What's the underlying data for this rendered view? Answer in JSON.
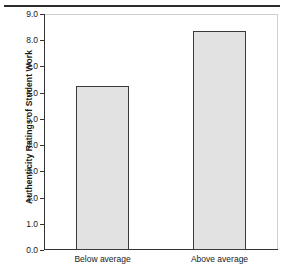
{
  "figure": {
    "background": "#ffffff",
    "caption_rule": "horizontal-rule",
    "caption_ghost": ""
  },
  "chart_data": {
    "type": "bar",
    "title": "",
    "subtitle": "",
    "xlabel": "",
    "ylabel": "Authenticity Ratings of Student Work",
    "categories": [
      "Below average",
      "Above average"
    ],
    "values": [
      6.25,
      8.35
    ],
    "ylim": [
      0.0,
      9.0
    ],
    "ytick_labels": [
      "0.0",
      "1.0",
      "2.0",
      "3.0",
      "4.0",
      "5.0",
      "6.0",
      "7.0",
      "8.0",
      "9.0"
    ],
    "ytick_values": [
      0.0,
      1.0,
      2.0,
      3.0,
      4.0,
      5.0,
      6.0,
      7.0,
      8.0,
      9.0
    ],
    "ytick_step": 1.0,
    "grid": false,
    "legend": null,
    "legend_position": "none",
    "annotations": [],
    "bar_fill_color": "#e2e2e2",
    "bar_edge_color": "#3a3a3a",
    "axis_color": "#333333",
    "frame_color": "#cfcfcf"
  }
}
